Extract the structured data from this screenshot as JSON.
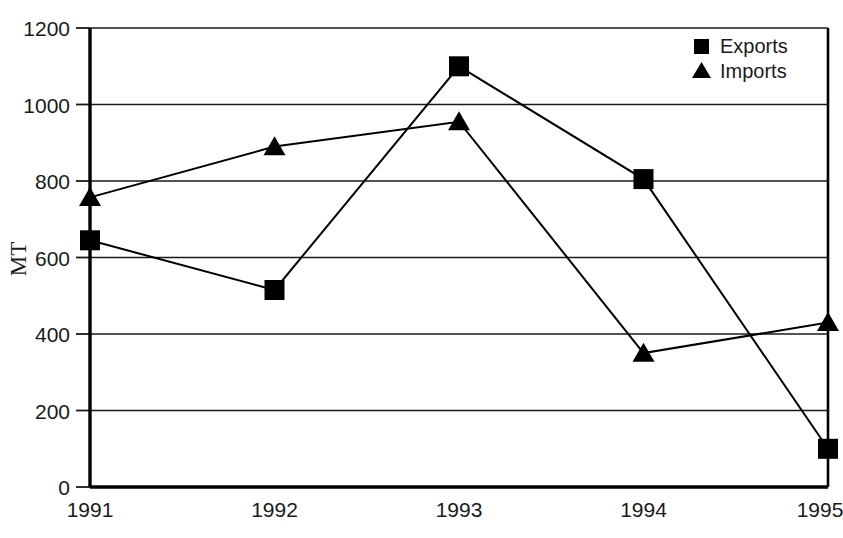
{
  "chart_data": {
    "type": "line",
    "title": "",
    "xlabel": "",
    "ylabel": "MT",
    "categories": [
      "1991",
      "1992",
      "1993",
      "1994",
      "1995"
    ],
    "series": [
      {
        "name": "Exports",
        "marker": "square",
        "color": "#000000",
        "values": [
          645,
          515,
          1100,
          805,
          100
        ]
      },
      {
        "name": "Imports",
        "marker": "triangle",
        "color": "#000000",
        "values": [
          757,
          890,
          955,
          350,
          430
        ]
      }
    ],
    "ylim": [
      0,
      1200
    ],
    "ytick_values": [
      0,
      200,
      400,
      600,
      800,
      1000,
      1200
    ],
    "ytick_labels": [
      "0",
      "200",
      "400",
      "600",
      "800",
      "1000",
      "1200"
    ],
    "grid": "horizontal",
    "legend_position": "top-right-inside",
    "legend_entries": [
      "Exports",
      "Imports"
    ]
  },
  "axes": {
    "y_axis_title": "MT",
    "y_ticks": [
      "1200",
      "1000",
      "800",
      "600",
      "400",
      "200",
      "0"
    ],
    "x_ticks": [
      "1991",
      "1992",
      "1993",
      "1994",
      "1995"
    ]
  },
  "legend": {
    "items": [
      {
        "label": "Exports",
        "marker": "square-marker"
      },
      {
        "label": "Imports",
        "marker": "triangle-marker"
      }
    ]
  },
  "artifacts": {
    "cropped_caption_fragment": ""
  }
}
